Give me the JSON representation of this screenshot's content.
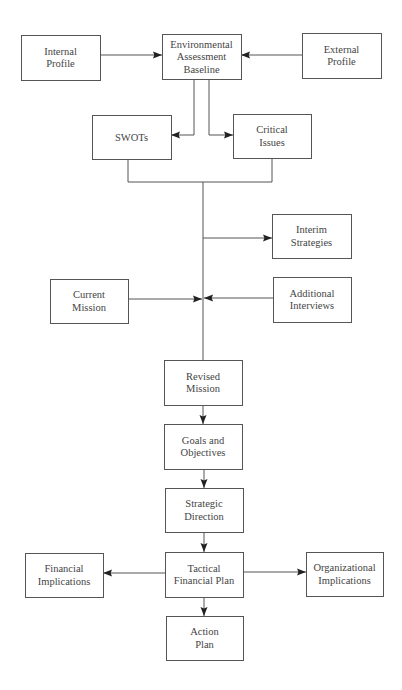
{
  "diagram": {
    "type": "flowchart",
    "title": "",
    "colors": {
      "stroke": "#555555",
      "arrow": "#222222",
      "text": "#444444",
      "background": "#ffffff"
    },
    "nodes": [
      {
        "id": "internal_profile",
        "lines": [
          "Internal",
          "Profile"
        ],
        "x": 21,
        "y": 35,
        "w": 79,
        "h": 45
      },
      {
        "id": "environmental_assessment_baseline",
        "lines": [
          "Environmental",
          "Assessment",
          "Baseline"
        ],
        "x": 162,
        "y": 34,
        "w": 79,
        "h": 45
      },
      {
        "id": "external_profile",
        "lines": [
          "External",
          "Profile"
        ],
        "x": 302,
        "y": 33,
        "w": 79,
        "h": 45
      },
      {
        "id": "swots",
        "lines": [
          "SWOTs"
        ],
        "x": 92,
        "y": 115,
        "w": 79,
        "h": 44
      },
      {
        "id": "critical_issues",
        "lines": [
          "Critical",
          "Issues"
        ],
        "x": 233,
        "y": 114,
        "w": 78,
        "h": 44
      },
      {
        "id": "interim_strategies",
        "lines": [
          "Interim",
          "Strategies"
        ],
        "x": 272,
        "y": 214,
        "w": 79,
        "h": 44
      },
      {
        "id": "current_mission",
        "lines": [
          "Current",
          "Mission"
        ],
        "x": 50,
        "y": 279,
        "w": 78,
        "h": 44
      },
      {
        "id": "additional_interviews",
        "lines": [
          "Additional",
          "Interviews"
        ],
        "x": 273,
        "y": 277,
        "w": 78,
        "h": 45
      },
      {
        "id": "revised_mission",
        "lines": [
          "Revised",
          "Mission"
        ],
        "x": 164,
        "y": 360,
        "w": 78,
        "h": 45
      },
      {
        "id": "goals_and_objectives",
        "lines": [
          "Goals and",
          "Objectives"
        ],
        "x": 164,
        "y": 424,
        "w": 78,
        "h": 45
      },
      {
        "id": "strategic_direction",
        "lines": [
          "Strategic",
          "Direction"
        ],
        "x": 165,
        "y": 488,
        "w": 78,
        "h": 44
      },
      {
        "id": "tactical_financial_plan",
        "lines": [
          "Tactical",
          "Financial Plan"
        ],
        "x": 165,
        "y": 552,
        "w": 78,
        "h": 45
      },
      {
        "id": "financial_implications",
        "lines": [
          "Financial",
          "Implications"
        ],
        "x": 25,
        "y": 553,
        "w": 78,
        "h": 44
      },
      {
        "id": "organizational_implications",
        "lines": [
          "Organizational",
          "Implications"
        ],
        "x": 306,
        "y": 552,
        "w": 77,
        "h": 44
      },
      {
        "id": "action_plan",
        "lines": [
          "Action",
          "Plan"
        ],
        "x": 166,
        "y": 616,
        "w": 77,
        "h": 44
      }
    ],
    "edges": [
      {
        "from": "internal_profile",
        "to": "environmental_assessment_baseline",
        "points": [
          [
            100,
            55
          ],
          [
            162,
            55
          ]
        ],
        "arrow": "end"
      },
      {
        "from": "external_profile",
        "to": "environmental_assessment_baseline",
        "points": [
          [
            302,
            55
          ],
          [
            241,
            55
          ]
        ],
        "arrow": "end"
      },
      {
        "from": "environmental_assessment_baseline",
        "to": "swots",
        "points": [
          [
            194,
            79
          ],
          [
            194,
            135
          ],
          [
            171,
            135
          ]
        ],
        "arrow": "end"
      },
      {
        "from": "environmental_assessment_baseline",
        "to": "critical_issues",
        "points": [
          [
            209,
            79
          ],
          [
            209,
            135
          ],
          [
            233,
            135
          ]
        ],
        "arrow": "end"
      },
      {
        "from": "swots",
        "to": "merge",
        "points": [
          [
            128,
            159
          ],
          [
            128,
            182
          ],
          [
            272,
            182
          ],
          [
            272,
            158
          ]
        ],
        "arrow": "none"
      },
      {
        "from": "merge",
        "to": "revised_mission",
        "points": [
          [
            203,
            182
          ],
          [
            203,
            360
          ]
        ],
        "arrow": "none"
      },
      {
        "from": "trunk",
        "to": "interim_strategies",
        "points": [
          [
            203,
            238
          ],
          [
            272,
            238
          ]
        ],
        "arrow": "end"
      },
      {
        "from": "current_mission",
        "to": "trunk",
        "points": [
          [
            128,
            299
          ],
          [
            202,
            299
          ]
        ],
        "arrow": "end"
      },
      {
        "from": "additional_interviews",
        "to": "trunk",
        "points": [
          [
            273,
            298
          ],
          [
            204,
            298
          ]
        ],
        "arrow": "end"
      },
      {
        "from": "revised_mission",
        "to": "goals_and_objectives",
        "points": [
          [
            203,
            405
          ],
          [
            203,
            424
          ]
        ],
        "arrow": "end"
      },
      {
        "from": "goals_and_objectives",
        "to": "strategic_direction",
        "points": [
          [
            204,
            469
          ],
          [
            204,
            488
          ]
        ],
        "arrow": "end"
      },
      {
        "from": "strategic_direction",
        "to": "tactical_financial_plan",
        "points": [
          [
            204,
            532
          ],
          [
            204,
            552
          ]
        ],
        "arrow": "end"
      },
      {
        "from": "tactical_financial_plan",
        "to": "financial_implications",
        "points": [
          [
            165,
            573
          ],
          [
            103,
            573
          ]
        ],
        "arrow": "end"
      },
      {
        "from": "tactical_financial_plan",
        "to": "organizational_implications",
        "points": [
          [
            243,
            572
          ],
          [
            306,
            572
          ]
        ],
        "arrow": "end"
      },
      {
        "from": "tactical_financial_plan",
        "to": "action_plan",
        "points": [
          [
            204,
            597
          ],
          [
            204,
            616
          ]
        ],
        "arrow": "end"
      }
    ]
  }
}
